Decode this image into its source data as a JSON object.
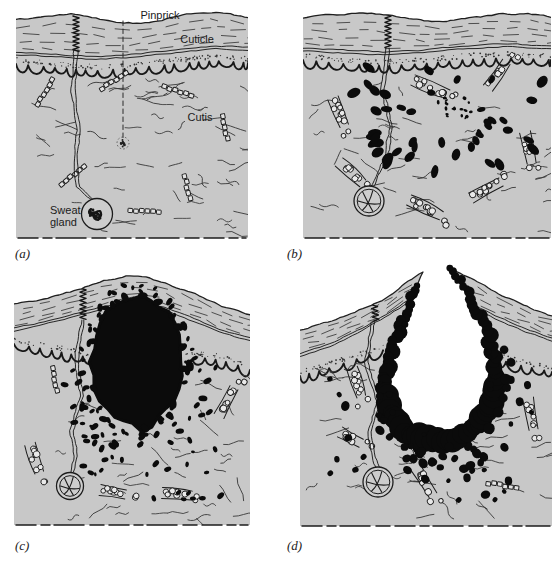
{
  "figure": {
    "annotations": {
      "pinprick": "Pinprick",
      "cuticle": "Cuticle",
      "cutis": "Cutis",
      "sweat_gland_line1": "Sweat",
      "sweat_gland_line2": "gland"
    },
    "panels": [
      {
        "letter": "(a)"
      },
      {
        "letter": "(b)"
      },
      {
        "letter": "(c)"
      },
      {
        "letter": "(d)"
      }
    ],
    "colors": {
      "background": "#ffffff",
      "tissue": "#c8c8c8",
      "ink": "#1c1c1c",
      "cell": "#0b0b0b"
    }
  }
}
